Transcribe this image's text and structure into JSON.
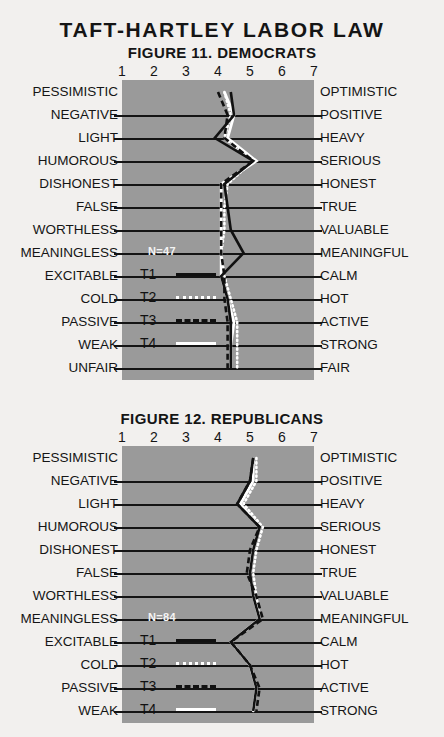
{
  "main_title": "TAFT-HARTLEY LABOR LAW",
  "figures": [
    {
      "id": "fig1",
      "title": "FIGURE 11. DEMOCRATS",
      "n_label": "N=47",
      "scale_numbers": [
        "1",
        "2",
        "3",
        "4",
        "5",
        "6",
        "7"
      ],
      "rows": [
        {
          "left": "PESSIMISTIC",
          "right": "OPTIMISTIC"
        },
        {
          "left": "NEGATIVE",
          "right": "POSITIVE"
        },
        {
          "left": "LIGHT",
          "right": "HEAVY"
        },
        {
          "left": "HUMOROUS",
          "right": "SERIOUS"
        },
        {
          "left": "DISHONEST",
          "right": "HONEST"
        },
        {
          "left": "FALSE",
          "right": "TRUE"
        },
        {
          "left": "WORTHLESS",
          "right": "VALUABLE"
        },
        {
          "left": "MEANINGLESS",
          "right": "MEANINGFUL"
        },
        {
          "left": "EXCITABLE",
          "right": "CALM"
        },
        {
          "left": "COLD",
          "right": "HOT"
        },
        {
          "left": "PASSIVE",
          "right": "ACTIVE"
        },
        {
          "left": "WEAK",
          "right": "STRONG"
        },
        {
          "left": "UNFAIR",
          "right": "FAIR"
        }
      ],
      "legend": [
        {
          "label": "T1",
          "style": "solid-black"
        },
        {
          "label": "T2",
          "style": "dot-white"
        },
        {
          "label": "T3",
          "style": "dash-black"
        },
        {
          "label": "T4",
          "style": "solid-white"
        }
      ]
    },
    {
      "id": "fig2",
      "title": "FIGURE 12. REPUBLICANS",
      "n_label": "N=84",
      "scale_numbers": [
        "1",
        "2",
        "3",
        "4",
        "5",
        "6",
        "7"
      ],
      "rows": [
        {
          "left": "PESSIMISTIC",
          "right": "OPTIMISTIC"
        },
        {
          "left": "NEGATIVE",
          "right": "POSITIVE"
        },
        {
          "left": "LIGHT",
          "right": "HEAVY"
        },
        {
          "left": "HUMOROUS",
          "right": "SERIOUS"
        },
        {
          "left": "DISHONEST",
          "right": "HONEST"
        },
        {
          "left": "FALSE",
          "right": "TRUE"
        },
        {
          "left": "WORTHLESS",
          "right": "VALUABLE"
        },
        {
          "left": "MEANINGLESS",
          "right": "MEANINGFUL"
        },
        {
          "left": "EXCITABLE",
          "right": "CALM"
        },
        {
          "left": "COLD",
          "right": "HOT"
        },
        {
          "left": "PASSIVE",
          "right": "ACTIVE"
        },
        {
          "left": "WEAK",
          "right": "STRONG"
        }
      ],
      "legend": [
        {
          "label": "T1",
          "style": "solid-black"
        },
        {
          "label": "T2",
          "style": "dot-white"
        },
        {
          "label": "T3",
          "style": "dash-black"
        },
        {
          "label": "T4",
          "style": "solid-white"
        }
      ]
    }
  ],
  "colors": {
    "plot_background": "#9a9a9a",
    "gridline": "#141414",
    "page_background": "#f2f0ee",
    "dark_series": "#111111",
    "light_series": "#ffffff"
  },
  "chart_data": [
    {
      "type": "line",
      "title": "FIGURE 11. DEMOCRATS",
      "subtitle": "TAFT-HARTLEY LABOR LAW",
      "orientation": "horizontal-profile",
      "xlabel": "",
      "ylabel": "",
      "xlim": [
        1,
        7
      ],
      "grid": true,
      "legend_position": "inside-lower-left",
      "n": 47,
      "categories": [
        "PESSIMISTIC-OPTIMISTIC",
        "NEGATIVE-POSITIVE",
        "LIGHT-HEAVY",
        "HUMOROUS-SERIOUS",
        "DISHONEST-HONEST",
        "FALSE-TRUE",
        "WORTHLESS-VALUABLE",
        "MEANINGLESS-MEANINGFUL",
        "EXCITABLE-CALM",
        "COLD-HOT",
        "PASSIVE-ACTIVE",
        "WEAK-STRONG",
        "UNFAIR-FAIR"
      ],
      "series": [
        {
          "name": "T1",
          "style": "solid-black",
          "values": [
            4.4,
            4.5,
            3.9,
            5.1,
            4.2,
            4.3,
            4.4,
            4.8,
            4.1,
            4.3,
            4.4,
            4.4,
            4.4
          ]
        },
        {
          "name": "T2",
          "style": "dotted-white",
          "values": [
            4.2,
            4.4,
            4.2,
            5.1,
            4.3,
            4.2,
            4.2,
            4.1,
            4.2,
            4.4,
            4.6,
            4.6,
            4.6
          ]
        },
        {
          "name": "T3",
          "style": "dashed-black",
          "values": [
            4.0,
            4.3,
            4.2,
            5.1,
            4.1,
            4.1,
            4.1,
            4.1,
            4.2,
            4.2,
            4.3,
            4.3,
            4.3
          ]
        },
        {
          "name": "T4",
          "style": "solid-white",
          "values": [
            4.2,
            4.5,
            4.3,
            5.2,
            4.1,
            4.1,
            4.1,
            4.1,
            4.1,
            4.3,
            4.5,
            4.4,
            4.4
          ]
        }
      ]
    },
    {
      "type": "line",
      "title": "FIGURE 12. REPUBLICANS",
      "subtitle": "TAFT-HARTLEY LABOR LAW",
      "orientation": "horizontal-profile",
      "xlabel": "",
      "ylabel": "",
      "xlim": [
        1,
        7
      ],
      "grid": true,
      "legend_position": "inside-lower-left",
      "n": 84,
      "categories": [
        "PESSIMISTIC-OPTIMISTIC",
        "NEGATIVE-POSITIVE",
        "LIGHT-HEAVY",
        "HUMOROUS-SERIOUS",
        "DISHONEST-HONEST",
        "FALSE-TRUE",
        "WORTHLESS-VALUABLE",
        "MEANINGLESS-MEANINGFUL",
        "EXCITABLE-CALM",
        "COLD-HOT",
        "PASSIVE-ACTIVE",
        "WEAK-STRONG"
      ],
      "series": [
        {
          "name": "T1",
          "style": "solid-black",
          "values": [
            5.1,
            5.0,
            4.6,
            5.3,
            5.1,
            5.0,
            5.1,
            5.3,
            4.4,
            5.0,
            5.2,
            5.1
          ]
        },
        {
          "name": "T2",
          "style": "dotted-white",
          "values": [
            5.2,
            5.2,
            4.8,
            5.4,
            5.2,
            5.1,
            5.2,
            5.3,
            4.4,
            5.0,
            5.2,
            5.1
          ]
        },
        {
          "name": "T3",
          "style": "dashed-black",
          "values": [
            5.1,
            5.0,
            4.6,
            5.3,
            5.0,
            4.9,
            5.2,
            5.4,
            4.4,
            5.0,
            5.3,
            5.2
          ]
        },
        {
          "name": "T4",
          "style": "solid-white",
          "values": [
            5.1,
            5.1,
            4.7,
            5.3,
            5.1,
            5.0,
            5.1,
            5.3,
            4.4,
            5.0,
            5.2,
            5.1
          ]
        }
      ]
    }
  ]
}
